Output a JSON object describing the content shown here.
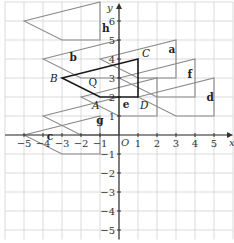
{
  "diagram": {
    "type": "coordinate-grid-translations",
    "axes": {
      "x_label": "x",
      "y_label": "y",
      "origin_label": "O",
      "x_ticks": [
        -5,
        -4,
        -3,
        -2,
        -1,
        1,
        2,
        3,
        4,
        5
      ],
      "y_ticks": [
        -5,
        -4,
        -3,
        -2,
        -1,
        1,
        2,
        3,
        4,
        5,
        6
      ],
      "x_range": [
        -6,
        6
      ],
      "y_range": [
        -5.5,
        7
      ]
    },
    "object_shape": {
      "label": "Q",
      "color": "#1a1a1a",
      "vertices": [
        {
          "name": "B",
          "x": -3,
          "y": 3
        },
        {
          "name": "C",
          "x": 1,
          "y": 4
        },
        {
          "name": "D",
          "x": 1,
          "y": 2
        },
        {
          "name": "A",
          "x": -1,
          "y": 2
        }
      ]
    },
    "image_shapes_color": "#8a8a8a",
    "image_shapes": [
      {
        "label": "a",
        "translation": [
          2,
          1
        ],
        "label_pos": [
          2.6,
          4.3
        ]
      },
      {
        "label": "b",
        "translation": [
          -1,
          1
        ],
        "label_pos": [
          -2.6,
          3.9
        ]
      },
      {
        "label": "c",
        "translation": [
          -2,
          -3
        ],
        "label_pos": [
          -3.8,
          -0.25
        ]
      },
      {
        "label": "d",
        "translation": [
          4,
          -1
        ],
        "label_pos": [
          4.6,
          1.8
        ]
      },
      {
        "label": "e",
        "translation": [
          1,
          -1
        ],
        "label_pos": [
          0.2,
          1.4
        ]
      },
      {
        "label": "f",
        "translation": [
          3,
          0
        ],
        "label_pos": [
          3.6,
          3.0
        ]
      },
      {
        "label": "g",
        "translation": [
          -1,
          -2
        ],
        "label_pos": [
          -1.2,
          0.6
        ]
      },
      {
        "label": "h",
        "translation": [
          -2,
          3
        ],
        "label_pos": [
          -0.9,
          5.4
        ]
      }
    ]
  }
}
